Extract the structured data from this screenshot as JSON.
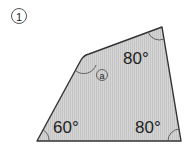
{
  "problem": {
    "number": "1",
    "number_display": "①"
  },
  "figure": {
    "shape": "quadrilateral",
    "fill_color": "#cfcfcf",
    "stroke_color": "#333333",
    "vertices": {
      "top_left": [
        85,
        55
      ],
      "top_right": [
        162,
        27
      ],
      "bottom_right": [
        181,
        141
      ],
      "bottom_left": [
        37,
        141
      ]
    },
    "angles": {
      "top_left": {
        "label": "a",
        "display": "ⓐ",
        "unknown": true
      },
      "top_right": {
        "label": "80°",
        "value": 80
      },
      "bottom_right": {
        "label": "80°",
        "value": 80
      },
      "bottom_left": {
        "label": "60°",
        "value": 60
      }
    }
  }
}
